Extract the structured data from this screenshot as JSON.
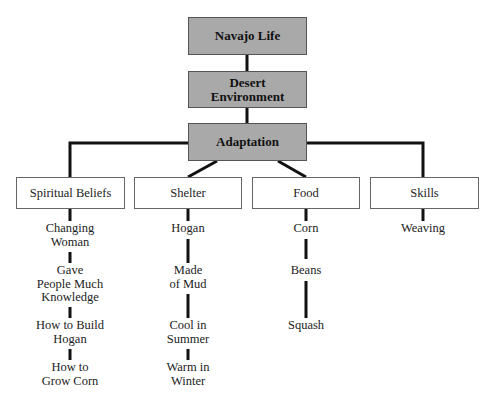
{
  "diagram": {
    "hierarchy": [
      {
        "id": "root",
        "label": "Navajo Life"
      },
      {
        "id": "environment",
        "label": "Desert Environment",
        "lines": [
          "Desert",
          "Environment"
        ]
      },
      {
        "id": "adaptation",
        "label": "Adaptation"
      }
    ],
    "categories": [
      {
        "id": "spiritual",
        "label": "Spiritual Beliefs",
        "items": [
          {
            "label": "Changing Woman",
            "lines": [
              "Changing",
              "Woman"
            ]
          },
          {
            "label": "Gave People Much Knowledge",
            "lines": [
              "Gave",
              "People Much",
              "Knowledge"
            ]
          },
          {
            "label": "How to Build Hogan",
            "lines": [
              "How to Build",
              "Hogan"
            ]
          },
          {
            "label": "How to Grow Corn",
            "lines": [
              "How to",
              "Grow Corn"
            ]
          }
        ]
      },
      {
        "id": "shelter",
        "label": "Shelter",
        "items": [
          {
            "label": "Hogan",
            "lines": [
              "Hogan"
            ]
          },
          {
            "label": "Made of Mud",
            "lines": [
              "Made",
              "of Mud"
            ]
          },
          {
            "label": "Cool in Summer",
            "lines": [
              "Cool in",
              "Summer"
            ]
          },
          {
            "label": "Warm in Winter",
            "lines": [
              "Warm in",
              "Winter"
            ]
          }
        ]
      },
      {
        "id": "food",
        "label": "Food",
        "items": [
          {
            "label": "Corn",
            "lines": [
              "Corn"
            ]
          },
          {
            "label": "Beans",
            "lines": [
              "Beans"
            ]
          },
          {
            "label": "Squash",
            "lines": [
              "Squash"
            ]
          }
        ]
      },
      {
        "id": "skills",
        "label": "Skills",
        "items": [
          {
            "label": "Weaving",
            "lines": [
              "Weaving"
            ]
          }
        ]
      }
    ],
    "colors": {
      "top_box_fill": "#a9a9a9",
      "category_box_fill": "#ffffff",
      "connector": "#111111"
    }
  }
}
